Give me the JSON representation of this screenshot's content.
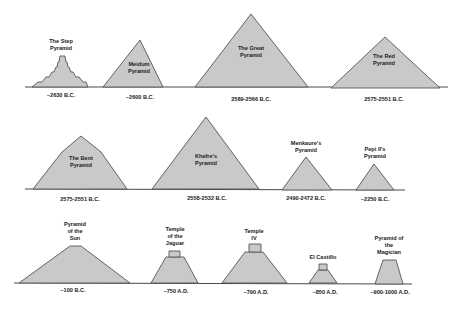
{
  "diagram": {
    "type": "pyramid-comparison-timeline",
    "colors": {
      "fill": "#c9c9c9",
      "stroke": "#555555",
      "baseline": "#4a4a4a",
      "text": "#222222",
      "background": "#ffffff"
    },
    "rows": [
      {
        "baseline_y": 87,
        "items": [
          {
            "id": "step",
            "name_lines": [
              "The Step",
              "Pyramid"
            ],
            "date": "~2630 B.C.",
            "shape": "stepped"
          },
          {
            "id": "meidum",
            "name_lines": [
              "Meidum",
              "Pyramid"
            ],
            "date": "~2600 B.C.",
            "shape": "triangle"
          },
          {
            "id": "great",
            "name_lines": [
              "The Great",
              "Pyramid"
            ],
            "date": "2589-2566 B.C.",
            "shape": "triangle"
          },
          {
            "id": "red",
            "name_lines": [
              "The Red",
              "Pyramid"
            ],
            "date": "2575-2551 B.C.",
            "shape": "triangle"
          }
        ]
      },
      {
        "baseline_y": 189,
        "items": [
          {
            "id": "bent",
            "name_lines": [
              "The Bent",
              "Pyramid"
            ],
            "date": "2575-2551 B.C.",
            "shape": "bent"
          },
          {
            "id": "khafre",
            "name_lines": [
              "Khafre's",
              "Pyramid"
            ],
            "date": "2558-2532 B.C.",
            "shape": "triangle"
          },
          {
            "id": "menkaure",
            "name_lines": [
              "Menkaure's",
              "Pyramid"
            ],
            "date": "2490-2472 B.C.",
            "shape": "triangle"
          },
          {
            "id": "pepi",
            "name_lines": [
              "Pepi II's",
              "Pyramid"
            ],
            "date": "~2250 B.C.",
            "shape": "triangle"
          }
        ]
      },
      {
        "baseline_y": 283,
        "items": [
          {
            "id": "sun",
            "name_lines": [
              "Pyramid",
              "of the",
              "Sun"
            ],
            "date": "~100 B.C.",
            "shape": "flat-top"
          },
          {
            "id": "jaguar",
            "name_lines": [
              "Temple",
              "of the",
              "Jaguar"
            ],
            "date": "~750 A.D.",
            "shape": "temple"
          },
          {
            "id": "temple4",
            "name_lines": [
              "Temple",
              "IV"
            ],
            "date": "~790 A.D.",
            "shape": "temple"
          },
          {
            "id": "castillo",
            "name_lines": [
              "El Castillo"
            ],
            "date": "~850 A.D.",
            "shape": "temple"
          },
          {
            "id": "magician",
            "name_lines": [
              "Pyramid of",
              "the",
              "Magician"
            ],
            "date": "~900-1000 A.D.",
            "shape": "temple"
          }
        ]
      }
    ]
  }
}
